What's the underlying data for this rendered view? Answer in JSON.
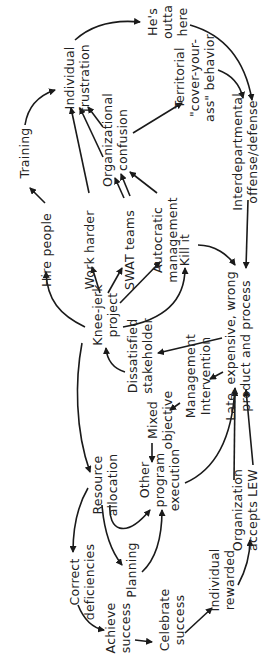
{
  "diagram": {
    "orientation": "rotated -90deg (text reads bottom-to-top)",
    "nodes": [
      {
        "id": "training",
        "lines": [
          "Training"
        ],
        "x": 25,
        "y": 153
      },
      {
        "id": "hire_people",
        "lines": [
          "Hire people"
        ],
        "x": 47,
        "y": 250
      },
      {
        "id": "individual_frustration",
        "lines": [
          "Individual",
          "frustration"
        ],
        "x": 77,
        "y": 78
      },
      {
        "id": "hes_outta_here",
        "lines": [
          "He's",
          "outta",
          "here"
        ],
        "x": 168,
        "y": 22
      },
      {
        "id": "work_harder",
        "lines": [
          "Work harder"
        ],
        "x": 90,
        "y": 250
      },
      {
        "id": "organizational_confusion",
        "lines": [
          "Organizational",
          "confusion"
        ],
        "x": 115,
        "y": 140
      },
      {
        "id": "territorial",
        "lines": [
          "Territorial",
          "\"cover-your-",
          "ass\" behavior"
        ],
        "x": 195,
        "y": 78
      },
      {
        "id": "swat_teams",
        "lines": [
          "SWAT teams"
        ],
        "x": 130,
        "y": 250
      },
      {
        "id": "autocratic_management",
        "lines": [
          "Autocratic",
          "management"
        ],
        "x": 165,
        "y": 240
      },
      {
        "id": "kill_it",
        "lines": [
          "Kill it"
        ],
        "x": 185,
        "y": 250
      },
      {
        "id": "interdepartmental",
        "lines": [
          "Interdepartmental",
          "offense/defense"
        ],
        "x": 245,
        "y": 152
      },
      {
        "id": "knee_jerk_project",
        "lines": [
          "Knee-jerk",
          "project"
        ],
        "x": 105,
        "y": 315
      },
      {
        "id": "dissatisfied_stakeholder",
        "lines": [
          "Dissatisfied",
          "stakeholder"
        ],
        "x": 140,
        "y": 356
      },
      {
        "id": "management_intervention",
        "lines": [
          "Management",
          "Intervention"
        ],
        "x": 198,
        "y": 376
      },
      {
        "id": "late_expensive",
        "lines": [
          "Late, expensive, wrong",
          "product and process"
        ],
        "x": 238,
        "y": 346
      },
      {
        "id": "mixed_objective",
        "lines": [
          "Mixed",
          "objective"
        ],
        "x": 160,
        "y": 420
      },
      {
        "id": "resource_allocation",
        "lines": [
          "Resource",
          "allocation"
        ],
        "x": 105,
        "y": 485
      },
      {
        "id": "other_program_execution",
        "lines": [
          "Other",
          "program",
          "execution"
        ],
        "x": 160,
        "y": 480
      },
      {
        "id": "correct_deficiencies",
        "lines": [
          "Correct",
          "deficiencies"
        ],
        "x": 82,
        "y": 582
      },
      {
        "id": "planning",
        "lines": [
          "Planning"
        ],
        "x": 132,
        "y": 570
      },
      {
        "id": "organization_accepts_lew",
        "lines": [
          "Organization",
          "accepts LEW"
        ],
        "x": 245,
        "y": 510
      },
      {
        "id": "individual_rewarded",
        "lines": [
          "Individual",
          "rewarded"
        ],
        "x": 222,
        "y": 580
      },
      {
        "id": "achieve_success",
        "lines": [
          "Achieve",
          "success"
        ],
        "x": 118,
        "y": 628
      },
      {
        "id": "celebrate_success",
        "lines": [
          "Celebrate",
          "success"
        ],
        "x": 172,
        "y": 620
      }
    ],
    "edges": [
      [
        "hire_people",
        "training"
      ],
      [
        "training",
        "individual_frustration"
      ],
      [
        "individual_frustration",
        "hes_outta_here"
      ],
      [
        "hes_outta_here",
        "interdepartmental"
      ],
      [
        "territorial",
        "interdepartmental"
      ],
      [
        "organizational_confusion",
        "territorial"
      ],
      [
        "organizational_confusion",
        "individual_frustration"
      ],
      [
        "work_harder",
        "individual_frustration"
      ],
      [
        "swat_teams",
        "individual_frustration"
      ],
      [
        "swat_teams",
        "organizational_confusion"
      ],
      [
        "autocratic_management",
        "organizational_confusion"
      ],
      [
        "knee_jerk_project",
        "hire_people"
      ],
      [
        "knee_jerk_project",
        "work_harder"
      ],
      [
        "knee_jerk_project",
        "swat_teams"
      ],
      [
        "knee_jerk_project",
        "autocratic_management"
      ],
      [
        "knee_jerk_project",
        "kill_it"
      ],
      [
        "kill_it",
        "late_expensive"
      ],
      [
        "interdepartmental",
        "late_expensive"
      ],
      [
        "late_expensive",
        "dissatisfied_stakeholder"
      ],
      [
        "late_expensive",
        "management_intervention"
      ],
      [
        "dissatisfied_stakeholder",
        "knee_jerk_project"
      ],
      [
        "management_intervention",
        "mixed_objective"
      ],
      [
        "mixed_objective",
        "other_program_execution"
      ],
      [
        "knee_jerk_project",
        "resource_allocation"
      ],
      [
        "resource_allocation",
        "other_program_execution"
      ],
      [
        "resource_allocation",
        "planning"
      ],
      [
        "resource_allocation",
        "correct_deficiencies"
      ],
      [
        "planning",
        "other_program_execution"
      ],
      [
        "other_program_execution",
        "late_expensive"
      ],
      [
        "correct_deficiencies",
        "achieve_success"
      ],
      [
        "achieve_success",
        "celebrate_success"
      ],
      [
        "celebrate_success",
        "individual_rewarded"
      ],
      [
        "individual_rewarded",
        "organization_accepts_lew"
      ],
      [
        "organization_accepts_lew",
        "late_expensive"
      ]
    ]
  }
}
